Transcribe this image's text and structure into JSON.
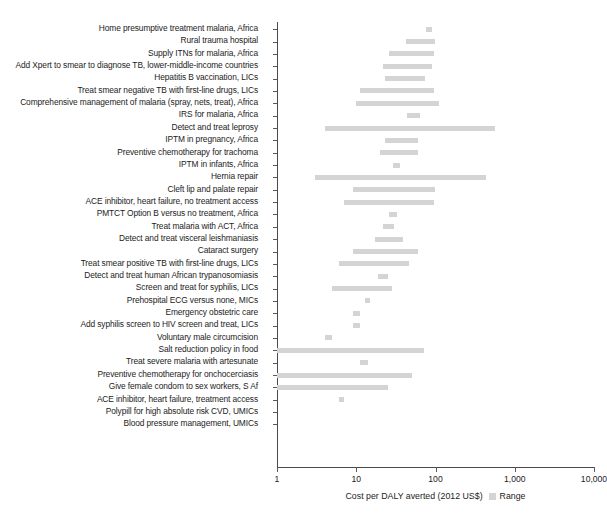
{
  "chart_data": {
    "type": "bar",
    "orientation": "horizontal",
    "title": "",
    "subtitle": "",
    "xlabel": "Cost per DALY averted (2012 US$)",
    "ylabel": "",
    "xscale": "log",
    "xlim": [
      1,
      10000
    ],
    "xticks": [
      1,
      10,
      100,
      1000,
      10000
    ],
    "xticklabels": [
      "1",
      "10",
      "100",
      "1,000",
      "10,000"
    ],
    "grid": false,
    "legend": {
      "position": "bottom",
      "entries": [
        {
          "label": "Range",
          "color": "#d4d4d4"
        }
      ]
    },
    "bar_color": "#d4d4d4",
    "categories": [
      "Home presumptive treatment malaria, Africa",
      "Rural trauma hospital",
      "Supply ITNs for malaria, Africa",
      "Add Xpert to smear to diagnose TB, lower-middle-income countries",
      "Hepatitis B vaccination, LICs",
      "Treat smear negative TB with first-line drugs, LICs",
      "Comprehensive management of malaria (spray, nets, treat), Africa",
      "IRS for malaria, Africa",
      "Detect and treat leprosy",
      "IPTM in pregnancy, Africa",
      "Preventive chemotherapy for trachoma",
      "IPTM in infants, Africa",
      "Hernia repair",
      "Cleft lip and palate repair",
      "ACE inhibitor, heart failure, no treatment access",
      "PMTCT Option B versus no treatment, Africa",
      "Treat malaria with ACT, Africa",
      "Detect and treat visceral leishmaniasis",
      "Cataract surgery",
      "Treat smear positive TB with first-line drugs, LICs",
      "Detect and treat human African trypanosomiasis",
      "Screen and treat for syphilis, LICs",
      "Prehospital ECG versus none, MICs",
      "Emergency obstetric care",
      "Add syphilis screen to HIV screen and treat, LICs",
      "Voluntary male circumcision",
      "Salt reduction policy in food",
      "Treat severe malaria with artesunate",
      "Preventive chemotherapy for onchocerciasis",
      "Give female condom to sex workers, S Af",
      "ACE inhibitor, heart failure, treatment access",
      "Polypill for high absolute risk CVD, UMICs",
      "Blood pressure management, UMICs"
    ],
    "ranges": [
      {
        "category": "Home presumptive treatment malaria, Africa",
        "low": 76,
        "high": 90
      },
      {
        "category": "Rural trauma hospital",
        "low": 43,
        "high": 98
      },
      {
        "category": "Supply ITNs for malaria, Africa",
        "low": 26,
        "high": 96
      },
      {
        "category": "Add Xpert to smear to diagnose TB, lower-middle-income countries",
        "low": 22,
        "high": 91
      },
      {
        "category": "Hepatitis B vaccination, LICs",
        "low": 23,
        "high": 74
      },
      {
        "category": "Treat smear negative TB with first-line drugs, LICs",
        "low": 11,
        "high": 95
      },
      {
        "category": "Comprehensive management of malaria (spray, nets, treat), Africa",
        "low": 10,
        "high": 110
      },
      {
        "category": "IRS for malaria, Africa",
        "low": 44,
        "high": 63
      },
      {
        "category": "Detect and treat leprosy",
        "low": 4,
        "high": 570
      },
      {
        "category": "IPTM in pregnancy, Africa",
        "low": 23,
        "high": 60
      },
      {
        "category": "Preventive chemotherapy for trachoma",
        "low": 20,
        "high": 60
      },
      {
        "category": "IPTM in infants, Africa",
        "low": 29,
        "high": 36
      },
      {
        "category": "Hernia repair",
        "low": 3,
        "high": 440
      },
      {
        "category": "Cleft lip and palate repair",
        "low": 9,
        "high": 100
      },
      {
        "category": "ACE inhibitor, heart failure, no treatment access",
        "low": 7,
        "high": 95
      },
      {
        "category": "PMTCT Option B versus no treatment, Africa",
        "low": 26,
        "high": 33
      },
      {
        "category": "Treat malaria with ACT, Africa",
        "low": 22,
        "high": 30
      },
      {
        "category": "Detect and treat visceral leishmaniasis",
        "low": 17,
        "high": 39
      },
      {
        "category": "Cataract surgery",
        "low": 9,
        "high": 60
      },
      {
        "category": "Treat smear positive TB with first-line drugs, LICs",
        "low": 6,
        "high": 46
      },
      {
        "category": "Detect and treat human African trypanosomiasis",
        "low": 19,
        "high": 25
      },
      {
        "category": "Screen and treat for syphilis, LICs",
        "low": 5,
        "high": 28
      },
      {
        "category": "Prehospital ECG versus none, MICs",
        "low": 13,
        "high": 15
      },
      {
        "category": "Emergency obstetric care",
        "low": 9,
        "high": 11
      },
      {
        "category": "Add syphilis screen to HIV screen and treat, LICs",
        "low": 9,
        "high": 11
      },
      {
        "category": "Voluntary male circumcision",
        "low": 4,
        "high": 5
      },
      {
        "category": "Salt reduction policy in food",
        "low": 1,
        "high": 72
      },
      {
        "category": "Treat severe malaria with artesunate",
        "low": 11,
        "high": 14
      },
      {
        "category": "Preventive chemotherapy for onchocerciasis",
        "low": 1,
        "high": 50
      },
      {
        "category": "Give female condom to sex workers, S Af",
        "low": 1,
        "high": 25
      },
      {
        "category": "ACE inhibitor, heart failure, treatment access",
        "low": 6,
        "high": 7
      },
      {
        "category": "Polypill for high absolute risk CVD, UMICs",
        "low": null,
        "high": null
      },
      {
        "category": "Blood pressure management, UMICs",
        "low": null,
        "high": null
      }
    ]
  }
}
